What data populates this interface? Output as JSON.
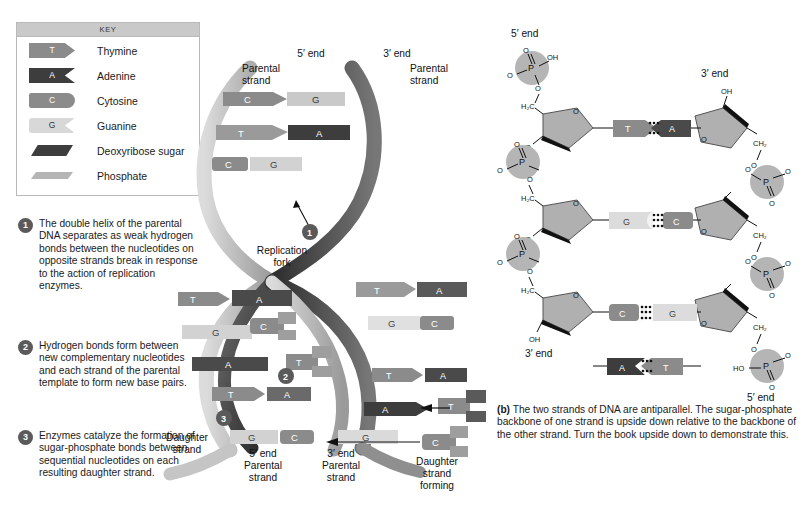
{
  "key": {
    "title": "KEY",
    "items": [
      {
        "glyph": "T",
        "label": "Thymine",
        "shape": "thymine-tab"
      },
      {
        "glyph": "A",
        "label": "Adenine",
        "shape": "adenine-notch"
      },
      {
        "glyph": "C",
        "label": "Cytosine",
        "shape": "cytosine-round"
      },
      {
        "glyph": "G",
        "label": "Guanine",
        "shape": "guanine-notch"
      },
      {
        "glyph": "",
        "label": "Deoxyribose sugar",
        "shape": "sugar-parallelogram"
      },
      {
        "glyph": "",
        "label": "Phosphate",
        "shape": "phosphate-bar"
      }
    ]
  },
  "steps": [
    {
      "num": "1",
      "text": "The double helix of the parental DNA separates as weak hydrogen bonds between the nucleotides on opposite strands break in response to the action of replication enzymes."
    },
    {
      "num": "2",
      "text": "Hydrogen bonds form between new complementary nucleotides and each strand of the parental template to form new base pairs."
    },
    {
      "num": "3",
      "text": "Enzymes catalyze the formation of sugar-phosphate bonds between sequential nucleotides on each resulting daughter strand."
    }
  ],
  "helix": {
    "labels": {
      "five_prime_top": "5′ end",
      "three_prime_top": "3′ end",
      "parental_left": "Parental\nstrand",
      "parental_right": "Parental\nstrand",
      "replication_fork": "Replication\nfork",
      "daughter_strand": "Daughter\nstrand",
      "five_prime_parental_bottom": "5′ end\nParental\nstrand",
      "three_prime_parental_bottom": "3′ end\nParental\nstrand",
      "daughter_forming": "Daughter\nstrand\nforming"
    },
    "markers": [
      "1",
      "2",
      "3"
    ],
    "top_pairs": [
      {
        "left": "C",
        "right": "G"
      },
      {
        "left": "T",
        "right": "A"
      },
      {
        "left": "C",
        "right": "G"
      }
    ],
    "left_branch_pairs": [
      {
        "left": "T",
        "right": "A"
      },
      {
        "left": "G",
        "right": ""
      },
      {
        "left": "",
        "right": "A"
      },
      {
        "left": "T",
        "right": "A"
      }
    ],
    "right_branch_pairs": [
      {
        "left": "T",
        "right": "A"
      },
      {
        "left": "G",
        "right": "C"
      },
      {
        "left": "T",
        "right": "A"
      },
      {
        "left": "A",
        "right": ""
      }
    ],
    "bottom_pairs": [
      {
        "left": "G",
        "right": "C"
      },
      {
        "left": "G",
        "right": ""
      }
    ],
    "free_nucleotides": [
      "C",
      "T",
      "T",
      "C"
    ]
  },
  "panel_b": {
    "caption_tag": "(b)",
    "caption": " The two strands of DNA are antiparallel. The sugar-phosphate backbone of one strand is upside down relative to the backbone of the other strand. Turn the book upside down to demonstrate this.",
    "labels": {
      "five_prime_topleft": "5′ end",
      "three_prime_topright": "3′ end",
      "three_prime_bottomleft": "3′ end",
      "five_prime_bottomright": "5′ end",
      "hydroxyl": "OH",
      "hydroxyl_left": "HO",
      "methylene": "H₂C",
      "methylene_right": "CH₂",
      "phosphorus": "P",
      "oxygen": "O"
    },
    "base_pairs": [
      {
        "left": "T",
        "right": "A",
        "bonds": 2
      },
      {
        "left": "G",
        "right": "C",
        "bonds": 3
      },
      {
        "left": "C",
        "right": "G",
        "bonds": 3
      },
      {
        "left": "A",
        "right": "T",
        "bonds": 2
      }
    ]
  },
  "colors": {
    "thymine": "#8b8b8b",
    "adenine": "#3d3d3d",
    "cytosine": "#8b8b8b",
    "guanine": "#d8d8d8",
    "sugar": "#b0b0b0",
    "phosphate": "#b5b5b5",
    "backbone_dark": "#3a3a3a",
    "backbone_light": "#c9c9c9",
    "background": "#ffffff"
  }
}
